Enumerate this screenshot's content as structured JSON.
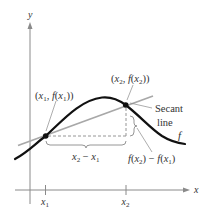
{
  "diagram": {
    "type": "secant-line-illustration",
    "axes": {
      "x_label": "x",
      "y_label": "y"
    },
    "ticks": {
      "x1": {
        "base": "x",
        "sub": "1"
      },
      "x2": {
        "base": "x",
        "sub": "2"
      }
    },
    "points": {
      "p1": {
        "label_parts": [
          "(x",
          "1",
          ", f(x",
          "1",
          "))"
        ],
        "label_text": "(x1, f(x1))"
      },
      "p2": {
        "label_parts": [
          "(x",
          "2",
          ", f(x",
          "2",
          "))"
        ],
        "label_text": "(x2, f(x2))"
      }
    },
    "labels": {
      "secant_line_1": "Secant",
      "secant_line_2": "line",
      "function": "f",
      "run": {
        "parts": [
          "x",
          "2",
          " − x",
          "1"
        ],
        "text": "x2 − x1"
      },
      "rise": {
        "parts": [
          "f(x",
          "2",
          ") − f(x",
          "1",
          ")"
        ],
        "text": "f(x2) − f(x1)"
      }
    },
    "colors": {
      "curve": "#111111",
      "secant": "#a8a8a8",
      "axes": "#8a8a8a",
      "text": "#333333"
    }
  }
}
